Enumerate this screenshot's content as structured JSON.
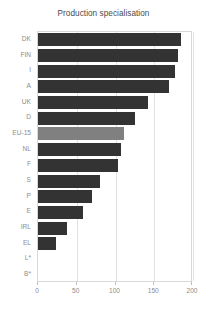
{
  "chart_data": {
    "type": "bar",
    "orientation": "horizontal",
    "title": "Production specialisation",
    "xlabel": "",
    "ylabel": "",
    "categories": [
      "DK",
      "FIN",
      "I",
      "A",
      "UK",
      "D",
      "EU-15",
      "NL",
      "F",
      "S",
      "P",
      "E",
      "IRL",
      "EL",
      "L*",
      "B*"
    ],
    "values": [
      185,
      180,
      177,
      169,
      142,
      125,
      111,
      107,
      103,
      80,
      70,
      58,
      37,
      23,
      0,
      0
    ],
    "xlim": [
      0,
      200
    ],
    "xticks": [
      0,
      50,
      100,
      150,
      200
    ],
    "xtick_labels": [
      "0",
      "50",
      "100",
      "150",
      "200"
    ],
    "grid": true,
    "grid_axis": "x",
    "legend": "none",
    "highlight_category": "EU-15",
    "bar_color": "#333333",
    "highlight_color": "#808080",
    "grid_color": "#e2e2e2",
    "frame_color": "#d8d8d8",
    "tick_label_color": "#8c8c8c",
    "title_color": "#4a4a4a",
    "background": "#ffffff"
  }
}
